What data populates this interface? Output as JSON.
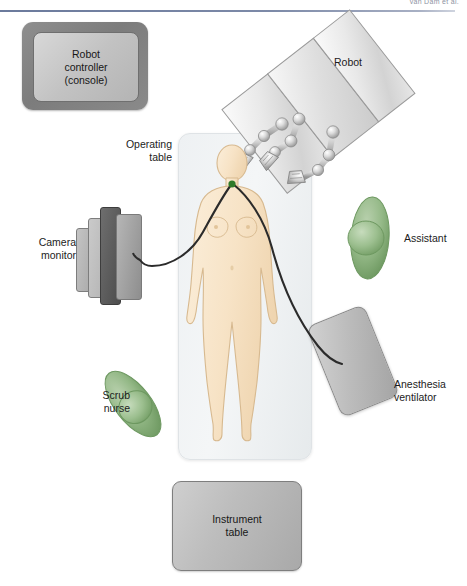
{
  "header": {
    "running_head": "van Dam et al."
  },
  "figure": {
    "width": 467,
    "height": 586
  },
  "labels": {
    "robot_controller": "Robot\ncontroller\n(console)",
    "robot": "Robot",
    "operating_table": "Operating\ntable",
    "camera_monitor": "Camera\nmonitor",
    "assistant": "Assistant",
    "scrub_nurse": "Scrub\nnurse",
    "anesthesia_ventilator": "Anesthesia\nventilator",
    "instrument_table": "Instrument\ntable"
  },
  "colors": {
    "rule": "#6b7a9c",
    "console_frame": "#7c7c7c",
    "console_screen": "#c2c2c2",
    "operating_table": "#eef1f3",
    "patient_skin": "#f6e0c4",
    "patient_outline": "#d7b98f",
    "staff_green": "#8fb583",
    "staff_green_dark": "#6f9a62",
    "robot_panel": "#e3e3e3",
    "robot_joint": "#d0d0d0",
    "tube": "#2b2b2b",
    "port_dot": "#2f7a2a",
    "instrument_table": "#bdbdbd",
    "ventilator": "#bcbcbc",
    "monitor_dark": "#4d4d4d",
    "text": "#1c1c1c"
  },
  "equipment": [
    {
      "name": "robot-controller-console",
      "label": "Robot controller (console)",
      "position": "top-left"
    },
    {
      "name": "robot",
      "label": "Robot",
      "position": "top-right",
      "arms": 3
    },
    {
      "name": "operating-table",
      "label": "Operating table",
      "position": "center"
    },
    {
      "name": "camera-monitor",
      "label": "Camera monitor",
      "position": "left"
    },
    {
      "name": "anesthesia-ventilator",
      "label": "Anesthesia ventilator",
      "position": "bottom-right"
    },
    {
      "name": "instrument-table",
      "label": "Instrument table",
      "position": "bottom-center"
    }
  ],
  "staff": [
    {
      "name": "assistant",
      "label": "Assistant",
      "position": "right"
    },
    {
      "name": "scrub-nurse",
      "label": "Scrub nurse",
      "position": "bottom-left"
    }
  ],
  "patient": {
    "name": "patient-figure",
    "orientation": "supine",
    "port_site": "neck",
    "tubes": 2
  }
}
